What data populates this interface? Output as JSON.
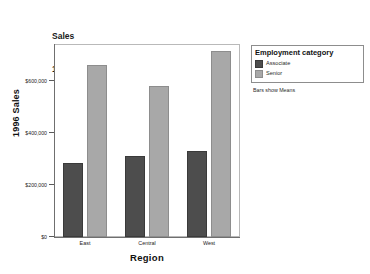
{
  "chart_data": {
    "type": "bar",
    "title": "Sales 1996",
    "title_lines": [
      "Sales",
      "1996"
    ],
    "xlabel": "Region",
    "ylabel": "1996 Sales",
    "categories": [
      "East",
      "Central",
      "West"
    ],
    "series": [
      {
        "name": "Associate",
        "color": "#4d4d4d",
        "values": [
          285000,
          310000,
          330000
        ]
      },
      {
        "name": "Senior",
        "color": "#a8a8a8",
        "values": [
          660000,
          578000,
          715000
        ]
      }
    ],
    "ylim": [
      0,
      740000
    ],
    "yticks": [
      0,
      200000,
      400000,
      600000
    ],
    "ytick_labels": [
      "$0",
      "$200,000",
      "$400,000",
      "$600,000"
    ],
    "grid": false,
    "legend_position": "right",
    "legend_title": "Employment category",
    "annotation": "Bars show Means"
  },
  "legend": {
    "title": "Employment category",
    "items": [
      {
        "label": "Associate",
        "color": "#4d4d4d"
      },
      {
        "label": "Senior",
        "color": "#a8a8a8"
      }
    ]
  },
  "footnote": "Bars show Means"
}
